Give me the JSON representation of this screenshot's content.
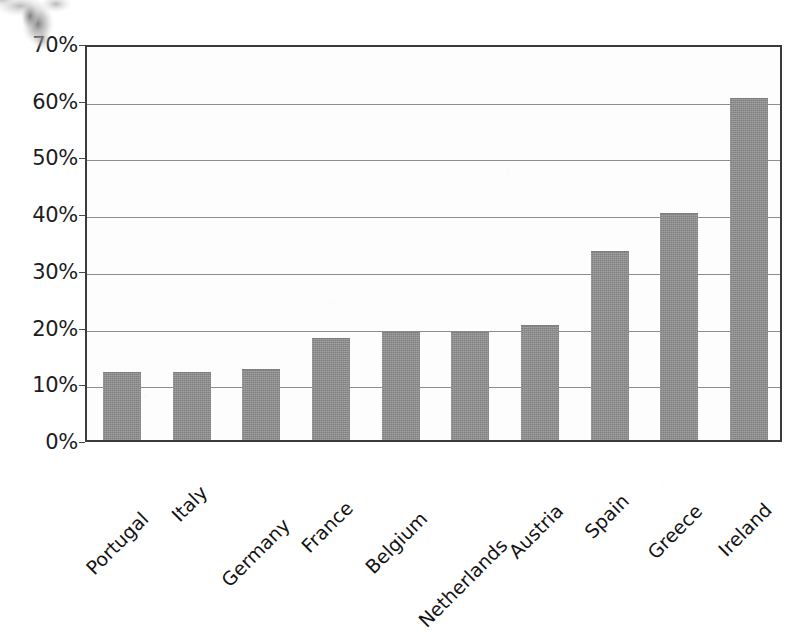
{
  "chart_data": {
    "type": "bar",
    "title": "",
    "subtitle": "",
    "xlabel": "",
    "ylabel": "",
    "categories": [
      "Portugal",
      "Italy",
      "Germany",
      "France",
      "Belgium",
      "Netherlands",
      "Austria",
      "Spain",
      "Greece",
      "Ireland"
    ],
    "values": [
      12.0,
      12.0,
      12.5,
      18.0,
      19.0,
      19.0,
      20.3,
      33.3,
      40.0,
      60.3
    ],
    "value_format": "percent",
    "ylim": [
      0,
      70
    ],
    "ytick_values": [
      0,
      10,
      20,
      30,
      40,
      50,
      60,
      70
    ],
    "ytick_labels": [
      "0%",
      "10%",
      "20%",
      "30%",
      "40%",
      "50%",
      "60%",
      "70%"
    ],
    "grid": true,
    "grid_axis": "y",
    "legend": false,
    "legend_position": "none",
    "annotations": [],
    "series": [
      {
        "name": "",
        "values": [
          12.0,
          12.0,
          12.5,
          18.0,
          19.0,
          19.0,
          20.3,
          33.3,
          40.0,
          60.3
        ]
      }
    ],
    "bar_color": "#8c8c8c",
    "xtick_label_rotation": -45
  },
  "colors": {
    "bar_fill": "#8c8c8c",
    "plot_border": "#3b3b3b",
    "gridline": "#8d8d8d",
    "text": "#141414",
    "background": "#ffffff"
  },
  "artifacts": {
    "smudge_name": "scan-smudge-top-left"
  }
}
